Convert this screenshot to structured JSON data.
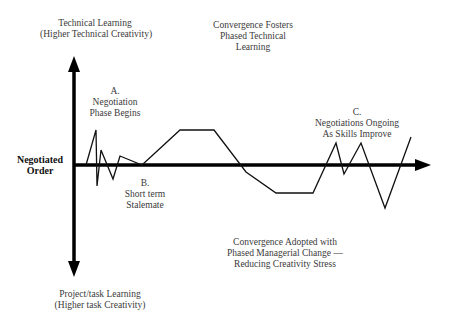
{
  "diagram": {
    "top_axis_label": [
      "Technical Learning",
      "(Higher Technical Creativity)"
    ],
    "bottom_axis_label": [
      "Project/task Learning",
      "(Higher task Creativity)"
    ],
    "left_axis_label": [
      "Negotiated",
      "Order"
    ],
    "annotations": {
      "a": [
        "A.",
        "Negotiation",
        "Phase Begins"
      ],
      "b": [
        "B.",
        "Short term",
        "Stalemate"
      ],
      "c": [
        "C.",
        "Negotiations Ongoing",
        "As Skills Improve"
      ],
      "convergence_top": [
        "Convergence Fosters",
        "Phased Technical",
        "Learning"
      ],
      "convergence_bottom": [
        "Convergence Adopted with",
        "Phased Managerial Change —",
        "Reducing Creativity Stress"
      ]
    },
    "line_points": "86,165 96,130 97,186 101,150 113,179 120,156 142,165 180,130 214,130 246,172 276,193 313,193 336,143 344,174 361,143 385,208 411,137",
    "colors": {
      "axis": "#000000",
      "line": "#111111",
      "text": "#3a3a3a"
    }
  }
}
